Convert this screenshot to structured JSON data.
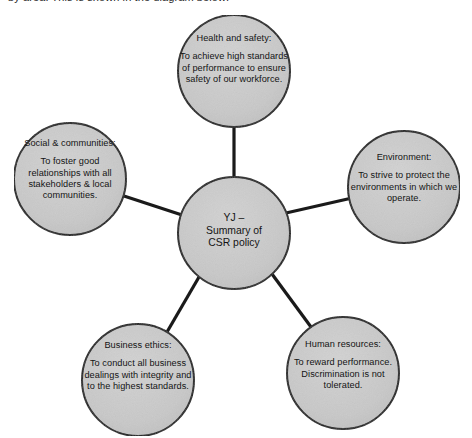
{
  "page": {
    "header_text": "by area. This is shown in the diagram below:",
    "background_color": "#ffffff"
  },
  "diagram": {
    "type": "hub-and-spoke",
    "node_fill_color": "#c9c9c9",
    "node_stroke_color": "#1a1a1a",
    "connector_color": "#1a1a1a",
    "center": {
      "id": "csr-policy-summary",
      "line1": "YJ –",
      "line2": "Summary of",
      "line3": "CSR policy",
      "cx": 234,
      "cy": 233,
      "r": 56
    },
    "nodes": [
      {
        "id": "health-and-safety",
        "title": "Health and safety:",
        "body": "To achieve high standards of performance to ensure safety of our workforce.",
        "cx": 234,
        "cy": 71,
        "r": 56
      },
      {
        "id": "environment",
        "title": "Environment:",
        "body": "To strive to protect the environments in which we operate.",
        "cx": 404,
        "cy": 187,
        "r": 56
      },
      {
        "id": "social-and-communities",
        "title": "Social & communities:",
        "body": "To foster good relationships with all stakeholders & local communities.",
        "cx": 70,
        "cy": 179,
        "r": 56
      },
      {
        "id": "business-ethics",
        "title": "Business ethics:",
        "body": "To conduct all business dealings with integrity and to the highest standards.",
        "cx": 138,
        "cy": 380,
        "r": 56
      },
      {
        "id": "human-resources",
        "title": "Human resources:",
        "body": "To reward performance. Discrimination is not tolerated.",
        "cx": 343,
        "cy": 373,
        "r": 56
      }
    ]
  }
}
